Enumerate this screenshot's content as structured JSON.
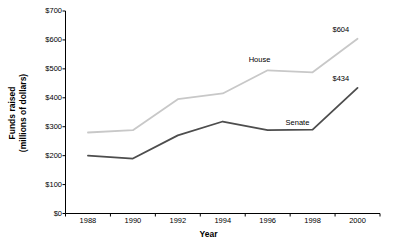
{
  "chart_data": {
    "type": "line",
    "title": "",
    "xlabel": "Year",
    "ylabel": "Funds raised\n(millions of dollars)",
    "ylabel_line1": "Funds raised",
    "ylabel_line2": "(millions of dollars)",
    "categories": [
      "1988",
      "1990",
      "1992",
      "1994",
      "1996",
      "1998",
      "2000"
    ],
    "x": [
      1988,
      1990,
      1992,
      1994,
      1996,
      1998,
      2000
    ],
    "xlim": [
      1987,
      2001
    ],
    "ylim": [
      0,
      700
    ],
    "yticks": [
      0,
      100,
      200,
      300,
      400,
      500,
      600,
      700
    ],
    "ytick_labels": [
      "$0",
      "$100",
      "$200",
      "$300",
      "$400",
      "$500",
      "$600",
      "$700"
    ],
    "grid": false,
    "legend": "inline-annotations",
    "series": [
      {
        "name": "House",
        "color": "#c8c8c8",
        "values": [
          280,
          288,
          395,
          415,
          495,
          488,
          604
        ],
        "label": "House",
        "end_value_label": "$604"
      },
      {
        "name": "Senate",
        "color": "#4d4d4d",
        "values": [
          200,
          190,
          270,
          318,
          288,
          290,
          434
        ],
        "label": "Senate",
        "end_value_label": "$434"
      }
    ],
    "annotations": [
      {
        "text": "House",
        "series": "House"
      },
      {
        "text": "Senate",
        "series": "Senate"
      },
      {
        "text": "$604",
        "series": "House"
      },
      {
        "text": "$434",
        "series": "Senate"
      }
    ]
  },
  "axis": {
    "line_color": "#000000"
  }
}
